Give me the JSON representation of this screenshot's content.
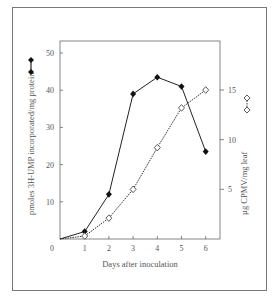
{
  "chart_data": {
    "type": "line",
    "title": "",
    "xlabel": "Days after inoculation",
    "ylabel_left": "pmoles 3H-UMP incorporated/mg protein",
    "ylabel_right": "µg CPMV/mg leaf",
    "x": [
      0,
      1,
      2,
      3,
      4,
      5,
      6
    ],
    "x_ticks": [
      "0",
      "1",
      "2",
      "3",
      "4",
      "5",
      "6"
    ],
    "y_left_ticks": [
      "10",
      "20",
      "30",
      "40",
      "50"
    ],
    "y_right_ticks": [
      "5",
      "10",
      "15"
    ],
    "ylim_left": [
      0,
      50
    ],
    "ylim_right": [
      0,
      15
    ],
    "grid": false,
    "series": [
      {
        "name": "3H-UMP incorporation (filled diamonds, solid line)",
        "axis": "left",
        "marker": "filled-diamond",
        "line": "solid",
        "values": [
          0,
          2,
          12,
          39,
          43.5,
          41,
          23.5
        ]
      },
      {
        "name": "CPMV content (open diamonds, dotted line)",
        "axis": "right",
        "marker": "open-diamond",
        "line": "dotted",
        "values": [
          0,
          0.3,
          2.1,
          5,
          9.2,
          13.2,
          15
        ]
      }
    ]
  }
}
